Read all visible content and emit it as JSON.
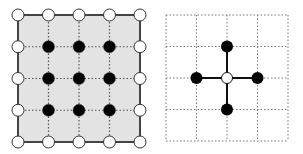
{
  "diagram": {
    "left_panel": {
      "description": "5x5 grid lattice with shaded region; boundary nodes open (white), interior nodes filled (black)",
      "origin": [
        18,
        15
      ],
      "step": [
        30.5,
        31.75
      ],
      "cols": 5,
      "rows": 5,
      "fill_color": "#e3e3e3",
      "border_color": "#444444",
      "boundary_node_fill": "#ffffff",
      "interior_node_fill": "#000000"
    },
    "right_panel": {
      "description": "4x4 dotted grid with a five-point stencil: open center node connected to four filled neighbors",
      "origin": [
        166,
        15
      ],
      "step": [
        30.5,
        31.5
      ],
      "cols": 5,
      "rows": 5,
      "center": [
        2,
        2
      ],
      "neighbors": [
        [
          2,
          1
        ],
        [
          1,
          2
        ],
        [
          3,
          2
        ],
        [
          2,
          3
        ]
      ],
      "center_node_fill": "#ffffff",
      "neighbor_node_fill": "#000000"
    }
  }
}
